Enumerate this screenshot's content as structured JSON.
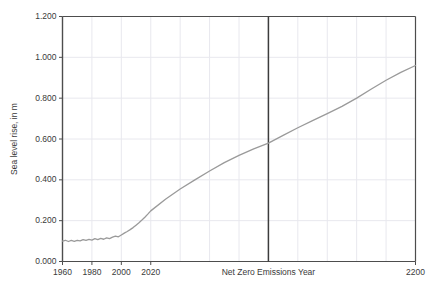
{
  "chart_data": {
    "type": "line",
    "title": "",
    "xlabel": "",
    "ylabel": "Sea level rise, in m",
    "xlim": [
      1960,
      2200
    ],
    "ylim": [
      0.0,
      1.2
    ],
    "grid": true,
    "legend": false,
    "xticks": [
      {
        "value": 1960,
        "label": "1960"
      },
      {
        "value": 1980,
        "label": "1980"
      },
      {
        "value": 2000,
        "label": "2000"
      },
      {
        "value": 2020,
        "label": "2020"
      },
      {
        "value": 2200,
        "label": "2200"
      }
    ],
    "yticks": [
      {
        "value": 0.0,
        "label": "0.000"
      },
      {
        "value": 0.2,
        "label": "0.200"
      },
      {
        "value": 0.4,
        "label": "0.400"
      },
      {
        "value": 0.6,
        "label": "0.600"
      },
      {
        "value": 0.8,
        "label": "0.800"
      },
      {
        "value": 1.0,
        "label": "1.000"
      },
      {
        "value": 1.2,
        "label": "1.200"
      }
    ],
    "gridlines_x": [
      1980,
      2000,
      2020,
      2040,
      2060,
      2080,
      2100,
      2120,
      2140,
      2160,
      2180
    ],
    "annotations": [
      {
        "name": "net-zero-emissions-year",
        "label": "Net Zero Emissions Year",
        "x": 2100,
        "type": "vertical-line"
      }
    ],
    "series": [
      {
        "name": "Sea level rise",
        "color": "#9a9a9a",
        "x": [
          1960,
          1962,
          1964,
          1966,
          1968,
          1970,
          1972,
          1974,
          1976,
          1978,
          1980,
          1982,
          1984,
          1986,
          1988,
          1990,
          1992,
          1994,
          1996,
          1998,
          2000,
          2002,
          2004,
          2006,
          2008,
          2010,
          2012,
          2014,
          2016,
          2018,
          2020,
          2030,
          2040,
          2050,
          2060,
          2070,
          2080,
          2090,
          2100,
          2110,
          2120,
          2130,
          2140,
          2150,
          2160,
          2170,
          2180,
          2190,
          2200
        ],
        "values": [
          0.1,
          0.104,
          0.098,
          0.103,
          0.099,
          0.104,
          0.101,
          0.107,
          0.103,
          0.108,
          0.105,
          0.112,
          0.107,
          0.113,
          0.109,
          0.116,
          0.112,
          0.119,
          0.124,
          0.121,
          0.13,
          0.139,
          0.147,
          0.156,
          0.166,
          0.178,
          0.19,
          0.203,
          0.217,
          0.232,
          0.248,
          0.305,
          0.355,
          0.4,
          0.443,
          0.484,
          0.52,
          0.552,
          0.58,
          0.618,
          0.655,
          0.69,
          0.724,
          0.76,
          0.8,
          0.845,
          0.888,
          0.926,
          0.96
        ]
      }
    ],
    "colors": {
      "axis": "#4d4d4d",
      "grid": "#e8e8ee",
      "line": "#9a9a9a",
      "annotation_line": "#3c3c3c",
      "text": "#3a3a3a",
      "background": "#ffffff"
    }
  }
}
